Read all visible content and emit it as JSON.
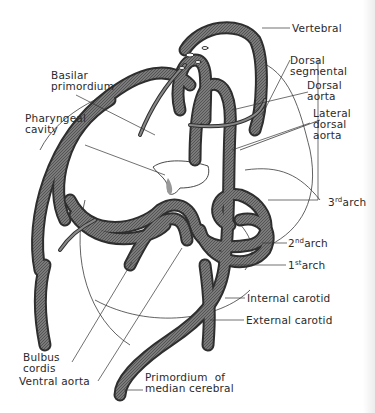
{
  "diagram": {
    "labels": [
      {
        "id": "vertebral",
        "lines": [
          "Vertebral"
        ]
      },
      {
        "id": "dorsal-segmental",
        "lines": [
          "Dorsal",
          "segmental"
        ]
      },
      {
        "id": "dorsal-aorta",
        "lines": [
          "Dorsal",
          "aorta"
        ]
      },
      {
        "id": "lateral-dorsal-aorta",
        "lines": [
          "Lateral",
          "dorsal",
          "aorta"
        ]
      },
      {
        "id": "basilar-primordium",
        "lines": [
          "Basilar",
          "primordium"
        ]
      },
      {
        "id": "pharyngeal-cavity",
        "lines": [
          "Pharyngeal",
          "cavity"
        ]
      },
      {
        "id": "third-arch",
        "num": "3",
        "sup": "rd",
        "text": "arch"
      },
      {
        "id": "second-arch",
        "num": "2",
        "sup": "nd",
        "text": "arch"
      },
      {
        "id": "first-arch",
        "num": "1",
        "sup": "st",
        "text": "arch"
      },
      {
        "id": "internal-carotid",
        "lines": [
          "Internal carotid"
        ]
      },
      {
        "id": "external-carotid",
        "lines": [
          "External carotid"
        ]
      },
      {
        "id": "bulbus-cordis",
        "lines": [
          "Bulbus",
          "cordis"
        ]
      },
      {
        "id": "ventral-aorta",
        "lines": [
          "Ventral aorta"
        ]
      },
      {
        "id": "primordium-median-cerebral",
        "lines": [
          "Primordium  of",
          "median cerebral"
        ]
      }
    ]
  },
  "colors": {
    "vessel_fill": "#6e6e6e",
    "vessel_edge": "#2e2e2e",
    "outline": "#3a3a3a",
    "text": "#2a2a2a",
    "background": "#ffffff"
  }
}
